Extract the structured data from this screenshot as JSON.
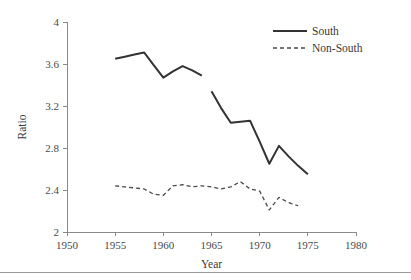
{
  "chart_data": {
    "type": "line",
    "title": "",
    "xlabel": "Year",
    "ylabel": "Ratio",
    "xlim": [
      1950,
      1980
    ],
    "ylim": [
      2,
      4
    ],
    "xticks": [
      1950,
      1955,
      1960,
      1965,
      1970,
      1975,
      1980
    ],
    "xtick_labels": [
      "1950",
      "1955",
      "1960",
      "1965",
      "1970",
      "1975",
      "1980"
    ],
    "yticks": [
      2,
      2.4,
      2.8,
      3.2,
      3.6,
      4
    ],
    "ytick_labels": [
      "2",
      "2.4",
      "2.8",
      "3.2",
      "3.6",
      "4"
    ],
    "grid": false,
    "legend_position": "top-right",
    "series": [
      {
        "name": "South",
        "style": "solid",
        "color": "#333333",
        "segments": [
          {
            "x": [
              1955,
              1956,
              1957,
              1958,
              1959,
              1960,
              1961,
              1962,
              1963,
              1964
            ],
            "values": [
              3.65,
              3.67,
              3.69,
              3.71,
              3.59,
              3.47,
              3.53,
              3.58,
              3.54,
              3.49
            ]
          },
          {
            "x": [
              1965,
              1966,
              1967,
              1968,
              1969,
              1970,
              1971,
              1972,
              1973,
              1974,
              1975
            ],
            "values": [
              3.34,
              3.18,
              3.04,
              3.05,
              3.06,
              2.86,
              2.65,
              2.82,
              2.72,
              2.63,
              2.55
            ]
          }
        ]
      },
      {
        "name": "Non-South",
        "style": "dashed",
        "color": "#4a4a4a",
        "segments": [
          {
            "x": [
              1955,
              1956,
              1957,
              1958,
              1959,
              1960,
              1961,
              1962,
              1963,
              1964,
              1965,
              1966,
              1967,
              1968,
              1969,
              1970,
              1971,
              1972,
              1973,
              1974
            ],
            "values": [
              2.44,
              2.43,
              2.42,
              2.41,
              2.36,
              2.35,
              2.44,
              2.45,
              2.43,
              2.44,
              2.43,
              2.41,
              2.43,
              2.48,
              2.41,
              2.39,
              2.21,
              2.33,
              2.28,
              2.25
            ]
          }
        ]
      }
    ]
  },
  "legend": {
    "entries": [
      {
        "label": "South"
      },
      {
        "label": "Non-South"
      }
    ]
  }
}
